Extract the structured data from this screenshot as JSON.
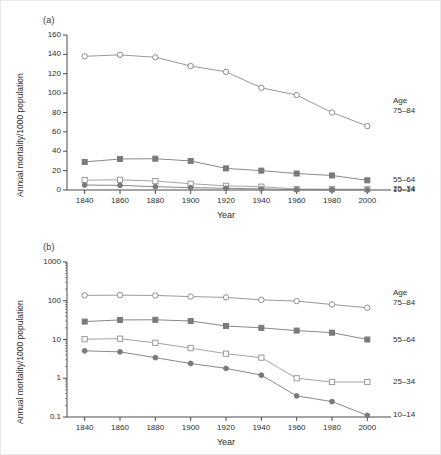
{
  "figure": {
    "panel_a_label": "(a)",
    "panel_b_label": "(b)",
    "legend_title": "Age"
  },
  "chart_data": [
    {
      "type": "line",
      "title": "(a)",
      "xlabel": "Year",
      "ylabel": "Annual mortality/1000 population",
      "x": [
        1840,
        1860,
        1880,
        1900,
        1920,
        1940,
        1960,
        1980,
        2000
      ],
      "xticklabels": [
        "1840",
        "1860",
        "1880",
        "1900",
        "1920",
        "1940",
        "1960",
        "1980",
        "2000"
      ],
      "xlim": [
        1830,
        2010
      ],
      "ylim": [
        0,
        160
      ],
      "yticks": [
        0,
        20,
        40,
        60,
        80,
        100,
        120,
        140,
        160
      ],
      "yticklabels": [
        "0",
        "20",
        "40",
        "60",
        "80",
        "100",
        "120",
        "140",
        "160"
      ],
      "yscale": "linear",
      "grid": false,
      "legend_position": "right",
      "series": [
        {
          "name": "75-84",
          "label": "75–84",
          "marker": "open-circle",
          "color": "#8c8c8c",
          "values": [
            138,
            139.5,
            137,
            128,
            122,
            105.5,
            98,
            80,
            66
          ]
        },
        {
          "name": "55-64",
          "label": "55–64",
          "marker": "filled-square",
          "color": "#7a7a7a",
          "values": [
            29,
            32,
            32.3,
            30,
            22.3,
            20,
            17,
            15,
            10
          ]
        },
        {
          "name": "25-34",
          "label": "25–34",
          "marker": "open-square",
          "color": "#9a9a9a",
          "values": [
            10.2,
            10.5,
            9.2,
            6.5,
            4.3,
            3.4,
            1.0,
            0.8,
            0.8
          ]
        },
        {
          "name": "10-14",
          "label": "10–14",
          "marker": "filled-circle",
          "color": "#7a7a7a",
          "values": [
            5.1,
            4.8,
            3.4,
            2.4,
            1.8,
            1.2,
            0.35,
            0.25,
            0.11
          ]
        }
      ]
    },
    {
      "type": "line",
      "title": "(b)",
      "xlabel": "Year",
      "ylabel": "Annual mortality/1000 population",
      "x": [
        1840,
        1860,
        1880,
        1900,
        1920,
        1940,
        1960,
        1980,
        2000
      ],
      "xticklabels": [
        "1840",
        "1860",
        "1880",
        "1900",
        "1920",
        "1940",
        "1960",
        "1980",
        "2000"
      ],
      "xlim": [
        1830,
        2010
      ],
      "ylim": [
        0.1,
        1000
      ],
      "yticks": [
        0.1,
        1,
        10,
        100,
        1000
      ],
      "yticklabels": [
        "0.1",
        "1",
        "10",
        "100",
        "1000"
      ],
      "yscale": "log",
      "grid": false,
      "legend_position": "right",
      "series": [
        {
          "name": "75-84",
          "label": "75–84",
          "marker": "open-circle",
          "color": "#8c8c8c",
          "values": [
            138,
            139.5,
            137,
            128,
            122,
            105.5,
            98,
            80,
            66
          ]
        },
        {
          "name": "55-64",
          "label": "55–64",
          "marker": "filled-square",
          "color": "#7a7a7a",
          "values": [
            29,
            32,
            32.3,
            30,
            22.3,
            20,
            17,
            15,
            10
          ]
        },
        {
          "name": "25-34",
          "label": "25–34",
          "marker": "open-square",
          "color": "#9a9a9a",
          "values": [
            10.2,
            10.5,
            8.2,
            6.0,
            4.3,
            3.4,
            1.0,
            0.8,
            0.8
          ]
        },
        {
          "name": "10-14",
          "label": "10–14",
          "marker": "filled-circle",
          "color": "#7a7a7a",
          "values": [
            5.1,
            4.8,
            3.4,
            2.4,
            1.8,
            1.2,
            0.35,
            0.25,
            0.11
          ]
        }
      ]
    }
  ]
}
